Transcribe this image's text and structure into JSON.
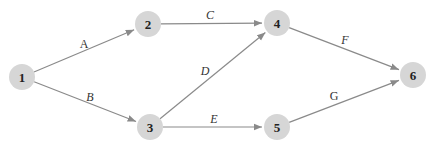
{
  "diagram": {
    "type": "activity-on-arrow network",
    "colors": {
      "node_fill": "#d6d6d6",
      "edge": "#8a8a8a",
      "text": "#222222",
      "background": "#ffffff"
    },
    "nodes": [
      {
        "id": "1",
        "label": "1",
        "x": 22,
        "y": 77
      },
      {
        "id": "2",
        "label": "2",
        "x": 148,
        "y": 24
      },
      {
        "id": "3",
        "label": "3",
        "x": 150,
        "y": 127
      },
      {
        "id": "4",
        "label": "4",
        "x": 277,
        "y": 23
      },
      {
        "id": "5",
        "label": "5",
        "x": 277,
        "y": 127
      },
      {
        "id": "6",
        "label": "6",
        "x": 413,
        "y": 75
      }
    ],
    "edges": [
      {
        "from": "1",
        "to": "2",
        "label": "A",
        "lx": 84,
        "ly": 48,
        "italic": false
      },
      {
        "from": "1",
        "to": "3",
        "label": "B",
        "lx": 90,
        "ly": 101,
        "italic": true
      },
      {
        "from": "2",
        "to": "4",
        "label": "C",
        "lx": 210,
        "ly": 19,
        "italic": true
      },
      {
        "from": "3",
        "to": "4",
        "label": "D",
        "lx": 205,
        "ly": 75,
        "italic": true
      },
      {
        "from": "3",
        "to": "5",
        "label": "E",
        "lx": 214,
        "ly": 123,
        "italic": true
      },
      {
        "from": "4",
        "to": "6",
        "label": "F",
        "lx": 345,
        "ly": 44,
        "italic": true
      },
      {
        "from": "5",
        "to": "6",
        "label": "G",
        "lx": 334,
        "ly": 100,
        "italic": false
      }
    ]
  }
}
